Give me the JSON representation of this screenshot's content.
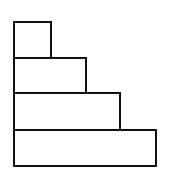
{
  "diagram": {
    "type": "staircase-stacked-rectangles",
    "stroke_color": "#111111",
    "background_color": "#ffffff",
    "blocks": [
      {
        "name": "block-1-top",
        "left": 13,
        "top": 21,
        "width": 39,
        "height": 38
      },
      {
        "name": "block-2",
        "left": 13,
        "top": 57,
        "width": 74,
        "height": 37
      },
      {
        "name": "block-3",
        "left": 13,
        "top": 92,
        "width": 108,
        "height": 39
      },
      {
        "name": "block-4-bottom",
        "left": 13,
        "top": 129,
        "width": 144,
        "height": 38
      }
    ]
  }
}
